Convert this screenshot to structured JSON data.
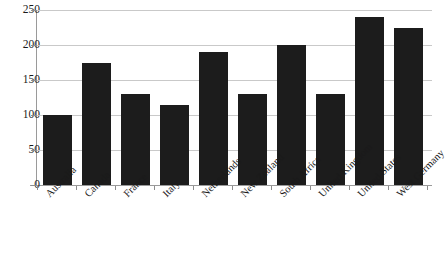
{
  "chart_data": {
    "type": "bar",
    "title": "",
    "subtitle": "",
    "xlabel": "",
    "ylabel": "",
    "ylim": [
      0,
      250
    ],
    "ytick_values": [
      0,
      50,
      100,
      150,
      200,
      250
    ],
    "ytick_labels": [
      "0",
      "50",
      "100",
      "150",
      "200",
      "250"
    ],
    "grid": true,
    "legend": false,
    "legend_position": "none",
    "bar_color": "#1c1c1c",
    "gridline_color": "#c9c9c9",
    "axis_color": "#9a9a9a",
    "categories": [
      "Australia",
      "Canada",
      "France",
      "Italy",
      "Netherlands",
      "New Zealand",
      "South Africa",
      "United Kingdom",
      "United States",
      "West Germany"
    ],
    "values": [
      100,
      175,
      130,
      115,
      190,
      130,
      200,
      130,
      240,
      225
    ],
    "series": [
      {
        "name": "Value",
        "values": [
          100,
          175,
          130,
          115,
          190,
          130,
          200,
          130,
          240,
          225
        ]
      }
    ]
  }
}
